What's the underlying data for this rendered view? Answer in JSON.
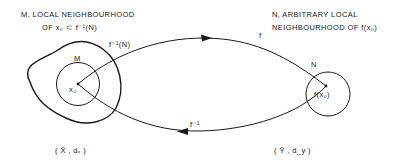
{
  "labels": {
    "m_title_line1": "M, LOCAL NEIGHBOURHOOD",
    "m_title_line2": "OF  x₀ ⊂ f⁻¹(N)",
    "n_title_line1": "N, ARBITRARY LOCAL",
    "n_title_line2": "NEIGHBOURHOOD OF f(x₀)",
    "finv_n": "f⁻¹(N)",
    "M": "M",
    "N": "N",
    "x0": "x₀",
    "fx0": "f(x₀)",
    "f": "f",
    "finv": "f⁻¹",
    "space_x": "( X̄ , dₓ )",
    "space_y": "( Ȳ , d_y )"
  },
  "colors": {
    "stroke": "#1a1a1a",
    "background": "#ffffff"
  }
}
